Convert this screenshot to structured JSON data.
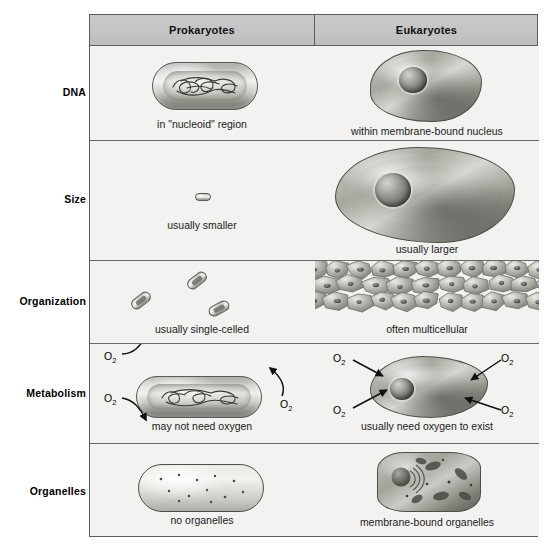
{
  "figure": {
    "accent_header_bg": "#c4c4c4",
    "cell_bg": "#f2f2f0",
    "border_color": "#5d5d5d"
  },
  "table": {
    "columns": [
      {
        "key": "prokaryotes",
        "label": "Prokaryotes"
      },
      {
        "key": "eukaryotes",
        "label": "Eukaryotes"
      }
    ],
    "rows": [
      {
        "key": "dna",
        "label": "DNA",
        "prokaryotes": {
          "caption": "in \"nucleoid\" region",
          "illustration": "rod-shaped-prokaryote-with-tangled-nucleoid-dna"
        },
        "eukaryotes": {
          "caption": "within membrane-bound nucleus",
          "illustration": "amoeboid-eukaryote-with-membrane-bound-nucleus"
        }
      },
      {
        "key": "size",
        "label": "Size",
        "prokaryotes": {
          "caption": "usually smaller",
          "illustration": "tiny-rod-shaped-prokaryote-to-scale"
        },
        "eukaryotes": {
          "caption": "usually larger",
          "illustration": "large-amoeboid-eukaryote-to-scale"
        }
      },
      {
        "key": "organization",
        "label": "Organization",
        "prokaryotes": {
          "caption": "usually single-celled",
          "illustration": "three-separate-free-floating-prokaryote-cells"
        },
        "eukaryotes": {
          "caption": "often multicellular",
          "illustration": "sheet-of-packed-eukaryotic-tissue-cells"
        }
      },
      {
        "key": "metabolism",
        "label": "Metabolism",
        "prokaryotes": {
          "caption": "may not need oxygen",
          "illustration": "prokaryote-with-oxygen-arrows-pointing-away",
          "oxygen_labels": [
            "O2",
            "O2",
            "O2"
          ],
          "arrow_direction": "outward"
        },
        "eukaryotes": {
          "caption": "usually need oxygen to exist",
          "illustration": "eukaryote-with-oxygen-arrows-pointing-inward",
          "oxygen_labels": [
            "O2",
            "O2",
            "O2",
            "O2"
          ],
          "arrow_direction": "inward"
        }
      },
      {
        "key": "organelles",
        "label": "Organelles",
        "prokaryotes": {
          "caption": "no organelles",
          "illustration": "empty-prokaryote-with-scattered-ribosome-dots"
        },
        "eukaryotes": {
          "caption": "membrane-bound organelles",
          "illustration": "eukaryote-with-nucleus-er-and-mitochondria"
        }
      }
    ]
  },
  "labels": {
    "oxygen": "O",
    "oxygen_subscript": "2"
  }
}
